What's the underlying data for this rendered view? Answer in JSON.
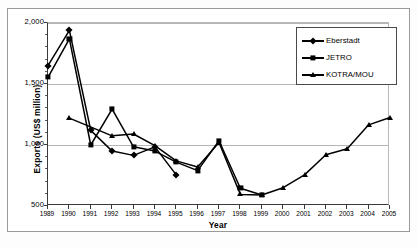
{
  "chart_data": {
    "type": "line",
    "title": "",
    "xlabel": "Year",
    "ylabel": "Exports  (US$ million)",
    "x": [
      1989,
      1990,
      1991,
      1992,
      1993,
      1994,
      1995,
      1996,
      1997,
      1998,
      1999,
      2000,
      2001,
      2002,
      2003,
      2004,
      2005
    ],
    "xtick_labels": [
      "1989",
      "1990",
      "1991",
      "1992",
      "1993",
      "1994",
      "1995",
      "1996",
      "1997",
      "1998",
      "1999",
      "2000",
      "2001",
      "2002",
      "2003",
      "2004",
      "2005"
    ],
    "ytick_labels": [
      "500",
      "1,000",
      "1,500",
      "2,000"
    ],
    "yticks": [
      500,
      1000,
      1500,
      2000
    ],
    "ylim": [
      500,
      2000
    ],
    "xlim": [
      1989,
      2005
    ],
    "grid": "horizontal",
    "legend_position": "top-right",
    "series": [
      {
        "name": "Eberstadt",
        "marker": "diamond",
        "color": "#000000",
        "points": [
          {
            "x": 1989,
            "y": 1650
          },
          {
            "x": 1990,
            "y": 1940
          },
          {
            "x": 1991,
            "y": 1120
          },
          {
            "x": 1992,
            "y": 950
          },
          {
            "x": 1993,
            "y": 915
          },
          {
            "x": 1994,
            "y": 985
          },
          {
            "x": 1995,
            "y": 755
          }
        ]
      },
      {
        "name": "JETRO",
        "marker": "square",
        "color": "#000000",
        "points": [
          {
            "x": 1989,
            "y": 1555
          },
          {
            "x": 1990,
            "y": 1870
          },
          {
            "x": 1991,
            "y": 1000
          },
          {
            "x": 1992,
            "y": 1295
          },
          {
            "x": 1993,
            "y": 985
          },
          {
            "x": 1994,
            "y": 950
          },
          {
            "x": 1995,
            "y": 860
          },
          {
            "x": 1996,
            "y": 790
          },
          {
            "x": 1997,
            "y": 1035
          },
          {
            "x": 1998,
            "y": 645
          },
          {
            "x": 1999,
            "y": 590
          }
        ]
      },
      {
        "name": "KOTRA/MOU",
        "marker": "triangle",
        "color": "#000000",
        "points": [
          {
            "x": 1990,
            "y": 1220
          },
          {
            "x": 1992,
            "y": 1075
          },
          {
            "x": 1993,
            "y": 1090
          },
          {
            "x": 1994,
            "y": 995
          },
          {
            "x": 1995,
            "y": 870
          },
          {
            "x": 1996,
            "y": 820
          },
          {
            "x": 1997,
            "y": 1020
          },
          {
            "x": 1998,
            "y": 595
          },
          {
            "x": 1999,
            "y": 590
          },
          {
            "x": 2000,
            "y": 650
          },
          {
            "x": 2001,
            "y": 755
          },
          {
            "x": 2002,
            "y": 920
          },
          {
            "x": 2003,
            "y": 970
          },
          {
            "x": 2004,
            "y": 1165
          },
          {
            "x": 2005,
            "y": 1225
          }
        ]
      }
    ]
  },
  "legend": {
    "items": [
      {
        "label": "Eberstadt",
        "marker": "diamond"
      },
      {
        "label": "JETRO",
        "marker": "square"
      },
      {
        "label": "KOTRA/MOU",
        "marker": "triangle"
      }
    ]
  }
}
